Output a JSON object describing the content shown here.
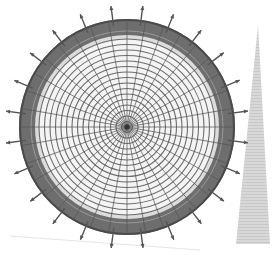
{
  "figure": {
    "type": "radial-grid-illustration",
    "center": [
      127,
      127
    ],
    "outer_radius": 108,
    "band_inner_radius": 92,
    "grid_radius": 88,
    "ring_count": 16,
    "spoke_count": 36,
    "arrow_count": 24,
    "arrow_length": 14
  },
  "colors": {
    "background": "#ffffff",
    "paper_edge": "#e6e6e6",
    "band": "#6e6e6e",
    "band_dark": "#4a4a4a",
    "grid_line": "#555555",
    "grid_fill": "#f4f4f4",
    "arrow": "#555555",
    "triangle": "#d4d4d4",
    "triangle_stripe": "#c6c6c6"
  },
  "triangle": {
    "apex": [
      258,
      25
    ],
    "base_left": [
      236,
      244
    ],
    "base_right": [
      270,
      244
    ]
  }
}
